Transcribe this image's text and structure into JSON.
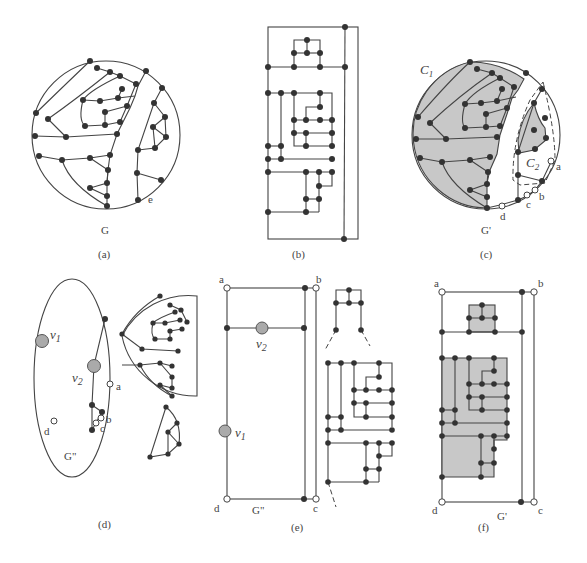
{
  "figure": {
    "panels": [
      {
        "id": "a",
        "caption": "(a)",
        "graph_label": "G",
        "edge_label": "e"
      },
      {
        "id": "b",
        "caption": "(b)"
      },
      {
        "id": "c",
        "caption": "(c)",
        "graph_label": "G'",
        "region_labels": [
          "C1",
          "C2"
        ],
        "terminal_labels": [
          "a",
          "b",
          "c",
          "d"
        ]
      },
      {
        "id": "d",
        "caption": "(d)",
        "graph_label": "G\"",
        "vertex_labels": [
          "v1",
          "v2"
        ],
        "terminal_labels": [
          "a",
          "b",
          "c",
          "d"
        ]
      },
      {
        "id": "e",
        "caption": "(e)",
        "graph_label": "G\"",
        "vertex_labels": [
          "v2",
          "v1"
        ],
        "terminal_labels": [
          "a",
          "b",
          "c",
          "d"
        ]
      },
      {
        "id": "f",
        "caption": "(f)",
        "graph_label": "G'",
        "terminal_labels": [
          "a",
          "b",
          "c",
          "d"
        ]
      }
    ]
  },
  "labels": {
    "a_cap": "(a)",
    "b_cap": "(b)",
    "c_cap": "(c)",
    "d_cap": "(d)",
    "e_cap": "(e)",
    "f_cap": "(f)",
    "G": "G",
    "e": "e",
    "Gp": "G'",
    "Gpp": "G\"",
    "C1": "C",
    "C1sub": "1",
    "C2": "C",
    "C2sub": "2",
    "v": "v",
    "v1sub": "1",
    "v2sub": "2",
    "a": "a",
    "b": "b",
    "c": "c",
    "d": "d"
  }
}
